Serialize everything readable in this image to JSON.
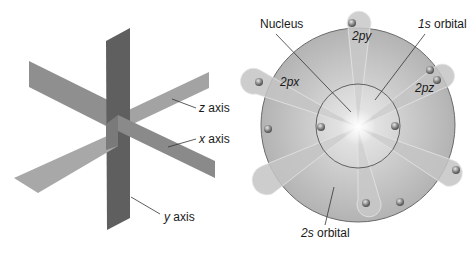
{
  "figure": {
    "left_panel": {
      "title": "Coordinate axes planes",
      "labels": {
        "z_axis": {
          "var": "z",
          "text": " axis"
        },
        "x_axis": {
          "var": "x",
          "text": " axis"
        },
        "y_axis": {
          "var": "y",
          "text": " axis"
        }
      },
      "colors": {
        "vertical_plane": "#5f5f5f",
        "band_z": "#9a9a9a",
        "band_x": "#8a8a8a",
        "leader_line": "#333333"
      }
    },
    "right_panel": {
      "title": "Atomic orbitals",
      "labels": {
        "nucleus": "Nucleus",
        "orbital_1s": {
          "var": "1s",
          "text": " orbital"
        },
        "orbital_2s": {
          "var": "2s",
          "text": " orbital"
        },
        "orbital_2px": "2px",
        "orbital_2py": "2py",
        "orbital_2pz": "2pz"
      },
      "colors": {
        "outer_sphere": "#bdbdbd",
        "outline": "#6b6b6b",
        "lobe": "#c4c4c4",
        "electron": "#8c8c8c",
        "nucleus_glow": "#f4f4f4"
      }
    }
  }
}
